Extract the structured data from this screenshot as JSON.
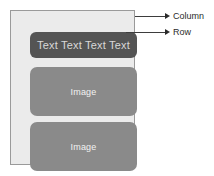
{
  "diagram": {
    "colors": {
      "page_background": "#ffffff",
      "column_background": "#ebebeb",
      "column_border": "#9a9a9a",
      "row_block": "#545454",
      "image_block": "#8a8a8a",
      "row_text": "#d8d8d8",
      "image_text": "#f2f2f2",
      "callout_stroke": "#2b2b2b",
      "callout_text": "#2b2b2b"
    },
    "column": {
      "name": "Column",
      "children": [
        {
          "kind": "row",
          "label": "Text Text Text Text"
        },
        {
          "kind": "image",
          "label": "Image"
        },
        {
          "kind": "image",
          "label": "Image"
        }
      ]
    },
    "callouts": [
      {
        "id": "column",
        "label": "Column",
        "points_to": "column-container"
      },
      {
        "id": "row",
        "label": "Row",
        "points_to": "row-block"
      }
    ]
  }
}
